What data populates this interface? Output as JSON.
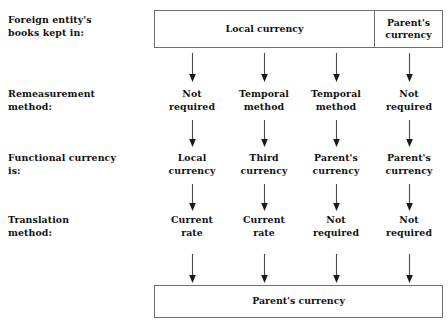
{
  "diagram": {
    "background_color": "#ffffff",
    "line_color": "#6e6e6e",
    "text_color": "#111111",
    "row_labels": [
      "Foreign entity's\nbooks kept in:",
      "Remeasurement\nmethod:",
      "Functional currency\nis:",
      "Translation\nmethod:"
    ],
    "top_box": {
      "cells": [
        "Local currency",
        "Parent's\ncurrency"
      ]
    },
    "bottom_box": {
      "label": "Parent's currency"
    },
    "columns": [
      {
        "remeasurement_method": "Not\nrequired",
        "functional_currency": "Local\ncurrency",
        "translation_method": "Current\nrate"
      },
      {
        "remeasurement_method": "Temporal\nmethod",
        "functional_currency": "Third\ncurrency",
        "translation_method": "Current\nrate"
      },
      {
        "remeasurement_method": "Temporal\nmethod",
        "functional_currency": "Parent's\ncurrency",
        "translation_method": "Not\nrequired"
      },
      {
        "remeasurement_method": "Not\nrequired",
        "functional_currency": "Parent's\ncurrency",
        "translation_method": "Not\nrequired"
      }
    ]
  }
}
